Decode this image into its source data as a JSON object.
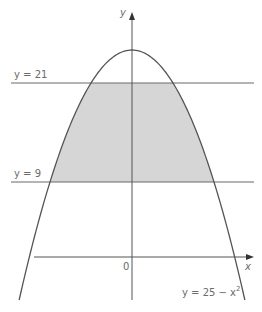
{
  "diagram": {
    "type": "graph",
    "curve": {
      "equation_label_prefix": "y = 25 − x",
      "equation_label_exp": "2",
      "a": 25,
      "b": -1
    },
    "lines": [
      {
        "label": "y = 21",
        "value": 21
      },
      {
        "label": "y = 9",
        "value": 9
      }
    ],
    "axes": {
      "x_label": "x",
      "y_label": "y",
      "origin_label": "0"
    },
    "shaded_region": "between y = 9 and y = 21 under the curve",
    "colors": {
      "axis": "#555555",
      "curve": "#555555",
      "line": "#6b6b6b",
      "shade": "#d6d6d6",
      "text": "#6b6b6b"
    }
  }
}
